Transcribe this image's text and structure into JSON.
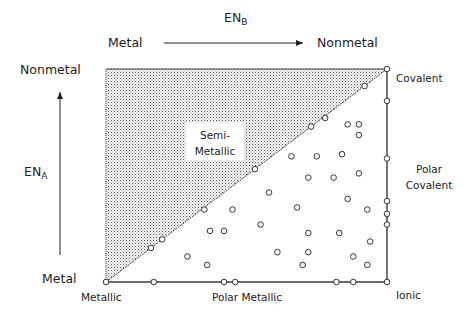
{
  "axes": {
    "x_axis_label": "EN",
    "x_axis_sub": "B",
    "x_start": "Metal",
    "x_end": "Nonmetal",
    "y_axis_label": "EN",
    "y_axis_sub": "A",
    "y_start": "Metal",
    "y_end": "Nonmetal"
  },
  "corners": {
    "bottom_left": "Metallic",
    "top_right": "Covalent",
    "bottom_right": "Ionic"
  },
  "edge_labels": {
    "bottom": "Polar Metallic",
    "right_line1": "Polar",
    "right_line2": "Covalent"
  },
  "regions": {
    "shaded_line1": "Semi-",
    "shaded_line2": "Metallic"
  },
  "colors": {
    "line": "#3a3a3a",
    "dot_pattern": "#555555"
  },
  "chart_data": {
    "type": "scatter",
    "title": "",
    "xlabel": "EN_B",
    "ylabel": "EN_A",
    "xlim": [
      0,
      1
    ],
    "ylim": [
      0,
      1
    ],
    "grid": false,
    "shaded_region": "upper-left triangle (Semi-Metallic)",
    "points": [
      {
        "x": 0.0,
        "y": 0.0
      },
      {
        "x": 1.0,
        "y": 1.0
      },
      {
        "x": 1.0,
        "y": 0.0
      },
      {
        "x": 0.17,
        "y": 0.0
      },
      {
        "x": 0.42,
        "y": 0.0
      },
      {
        "x": 0.46,
        "y": 0.0
      },
      {
        "x": 0.82,
        "y": 0.0
      },
      {
        "x": 0.88,
        "y": 0.0
      },
      {
        "x": 1.0,
        "y": 0.85
      },
      {
        "x": 1.0,
        "y": 0.58
      },
      {
        "x": 1.0,
        "y": 0.38
      },
      {
        "x": 1.0,
        "y": 0.32
      },
      {
        "x": 1.0,
        "y": 0.27
      },
      {
        "x": 0.16,
        "y": 0.16
      },
      {
        "x": 0.2,
        "y": 0.2
      },
      {
        "x": 0.35,
        "y": 0.34
      },
      {
        "x": 0.53,
        "y": 0.53
      },
      {
        "x": 0.73,
        "y": 0.73
      },
      {
        "x": 0.78,
        "y": 0.77
      },
      {
        "x": 0.92,
        "y": 0.92
      },
      {
        "x": 0.86,
        "y": 0.74
      },
      {
        "x": 0.9,
        "y": 0.74
      },
      {
        "x": 0.9,
        "y": 0.69
      },
      {
        "x": 0.66,
        "y": 0.59
      },
      {
        "x": 0.75,
        "y": 0.59
      },
      {
        "x": 0.84,
        "y": 0.6
      },
      {
        "x": 0.72,
        "y": 0.49
      },
      {
        "x": 0.81,
        "y": 0.49
      },
      {
        "x": 0.9,
        "y": 0.51
      },
      {
        "x": 0.58,
        "y": 0.42
      },
      {
        "x": 0.68,
        "y": 0.35
      },
      {
        "x": 0.86,
        "y": 0.39
      },
      {
        "x": 0.45,
        "y": 0.34
      },
      {
        "x": 0.93,
        "y": 0.34
      },
      {
        "x": 0.37,
        "y": 0.24
      },
      {
        "x": 0.42,
        "y": 0.24
      },
      {
        "x": 0.55,
        "y": 0.27
      },
      {
        "x": 0.72,
        "y": 0.23
      },
      {
        "x": 0.83,
        "y": 0.23
      },
      {
        "x": 0.94,
        "y": 0.19
      },
      {
        "x": 0.29,
        "y": 0.12
      },
      {
        "x": 0.36,
        "y": 0.08
      },
      {
        "x": 0.61,
        "y": 0.14
      },
      {
        "x": 0.72,
        "y": 0.14
      },
      {
        "x": 0.88,
        "y": 0.12
      },
      {
        "x": 0.93,
        "y": 0.08
      },
      {
        "x": 0.7,
        "y": 0.08
      }
    ]
  }
}
